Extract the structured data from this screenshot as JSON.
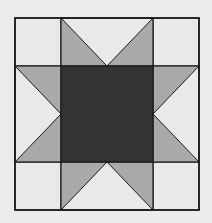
{
  "block": {
    "name": "Sawtooth Star quilt block",
    "grid": {
      "x": [
        15,
        61,
        153,
        199
      ],
      "y": [
        18,
        66,
        162,
        210
      ]
    },
    "colors": {
      "background": "#ececec",
      "light": "#e9e9e9",
      "gray": "#a9a9a9",
      "dark": "#333333",
      "line": "#1a1a1a"
    },
    "pieces": {
      "corners": [
        "top-left",
        "top-right",
        "bottom-left",
        "bottom-right"
      ],
      "star_points": [
        "top",
        "right",
        "bottom",
        "left"
      ],
      "center": "dark square"
    }
  }
}
